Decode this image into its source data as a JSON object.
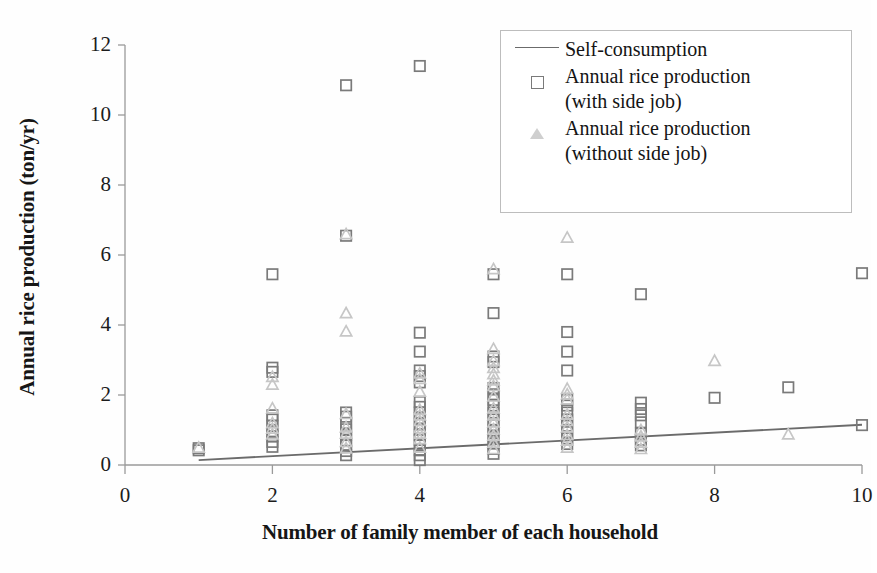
{
  "chart_data": {
    "type": "scatter",
    "title": "",
    "xlabel": "Number of family member of each household",
    "ylabel": "Annual rice production (ton/yr)",
    "xlim": [
      0,
      10
    ],
    "ylim": [
      0,
      12
    ],
    "xticks": [
      "0",
      "2",
      "4",
      "6",
      "8",
      "10"
    ],
    "yticks": [
      "0",
      "2",
      "4",
      "6",
      "8",
      "10",
      "12"
    ],
    "grid": false,
    "legend_position": "top-right",
    "colors": {
      "with_side_job": "#7a7a7a",
      "without_side_job": "#c6c6c6",
      "self_consumption": "#6b6b6b",
      "axis": "#9a9a9a",
      "text": "#161616",
      "background": "#fefefe"
    },
    "series": [
      {
        "name": "Self-consumption",
        "marker": "line",
        "type": "line",
        "points": [
          [
            1,
            0.14
          ],
          [
            10,
            1.15
          ]
        ]
      },
      {
        "name": "Annual rice production\n(with side job)",
        "marker": "open-square",
        "type": "scatter",
        "points": [
          [
            1,
            0.48
          ],
          [
            1,
            0.42
          ],
          [
            2,
            5.45
          ],
          [
            2,
            2.78
          ],
          [
            2,
            2.66
          ],
          [
            2,
            1.42
          ],
          [
            2,
            1.3
          ],
          [
            2,
            1.12
          ],
          [
            2,
            0.96
          ],
          [
            2,
            0.82
          ],
          [
            2,
            0.66
          ],
          [
            2,
            0.52
          ],
          [
            3,
            10.85
          ],
          [
            3,
            6.55
          ],
          [
            3,
            1.5
          ],
          [
            3,
            1.38
          ],
          [
            3,
            1.2
          ],
          [
            3,
            1.02
          ],
          [
            3,
            0.86
          ],
          [
            3,
            0.7
          ],
          [
            3,
            0.56
          ],
          [
            3,
            0.4
          ],
          [
            3,
            0.28
          ],
          [
            4,
            11.4
          ],
          [
            4,
            3.78
          ],
          [
            4,
            3.24
          ],
          [
            4,
            2.7
          ],
          [
            4,
            2.54
          ],
          [
            4,
            2.36
          ],
          [
            4,
            1.8
          ],
          [
            4,
            1.66
          ],
          [
            4,
            1.5
          ],
          [
            4,
            1.34
          ],
          [
            4,
            1.18
          ],
          [
            4,
            1.0
          ],
          [
            4,
            0.86
          ],
          [
            4,
            0.72
          ],
          [
            4,
            0.56
          ],
          [
            4,
            0.42
          ],
          [
            4,
            0.28
          ],
          [
            4,
            0.14
          ],
          [
            5,
            5.45
          ],
          [
            5,
            4.34
          ],
          [
            5,
            3.1
          ],
          [
            5,
            2.94
          ],
          [
            5,
            2.2
          ],
          [
            5,
            2.02
          ],
          [
            5,
            1.86
          ],
          [
            5,
            1.7
          ],
          [
            5,
            1.5
          ],
          [
            5,
            1.3
          ],
          [
            5,
            1.14
          ],
          [
            5,
            0.98
          ],
          [
            5,
            0.8
          ],
          [
            5,
            0.62
          ],
          [
            5,
            0.46
          ],
          [
            5,
            0.32
          ],
          [
            6,
            5.45
          ],
          [
            6,
            3.8
          ],
          [
            6,
            3.24
          ],
          [
            6,
            2.7
          ],
          [
            6,
            1.86
          ],
          [
            6,
            1.7
          ],
          [
            6,
            1.5
          ],
          [
            6,
            1.3
          ],
          [
            6,
            1.12
          ],
          [
            6,
            0.94
          ],
          [
            6,
            0.76
          ],
          [
            6,
            0.6
          ],
          [
            7,
            4.88
          ],
          [
            7,
            1.78
          ],
          [
            7,
            1.6
          ],
          [
            7,
            1.42
          ],
          [
            7,
            1.22
          ],
          [
            7,
            0.9
          ],
          [
            7,
            0.72
          ],
          [
            7,
            0.56
          ],
          [
            8,
            1.92
          ],
          [
            9,
            2.22
          ],
          [
            10,
            5.48
          ],
          [
            10,
            1.14
          ]
        ]
      },
      {
        "name": "Annual rice production\n(without side job)",
        "marker": "open-triangle",
        "type": "scatter",
        "points": [
          [
            1,
            0.5
          ],
          [
            2,
            2.52
          ],
          [
            2,
            2.3
          ],
          [
            2,
            1.62
          ],
          [
            2,
            1.2
          ],
          [
            2,
            1.04
          ],
          [
            2,
            0.88
          ],
          [
            3,
            6.6
          ],
          [
            3,
            4.34
          ],
          [
            3,
            3.82
          ],
          [
            3,
            1.46
          ],
          [
            3,
            1.08
          ],
          [
            3,
            0.9
          ],
          [
            3,
            0.66
          ],
          [
            3,
            0.48
          ],
          [
            4,
            2.62
          ],
          [
            4,
            2.46
          ],
          [
            4,
            2.1
          ],
          [
            4,
            1.58
          ],
          [
            4,
            1.42
          ],
          [
            4,
            1.26
          ],
          [
            4,
            1.06
          ],
          [
            4,
            0.9
          ],
          [
            4,
            0.74
          ],
          [
            4,
            0.5
          ],
          [
            5,
            5.6
          ],
          [
            5,
            3.32
          ],
          [
            5,
            2.98
          ],
          [
            5,
            2.78
          ],
          [
            5,
            2.6
          ],
          [
            5,
            2.42
          ],
          [
            5,
            2.26
          ],
          [
            5,
            1.96
          ],
          [
            5,
            1.62
          ],
          [
            5,
            1.42
          ],
          [
            5,
            1.22
          ],
          [
            5,
            1.02
          ],
          [
            5,
            0.84
          ],
          [
            5,
            0.64
          ],
          [
            5,
            0.46
          ],
          [
            6,
            6.5
          ],
          [
            6,
            2.18
          ],
          [
            6,
            2.02
          ],
          [
            6,
            1.88
          ],
          [
            6,
            1.44
          ],
          [
            6,
            1.26
          ],
          [
            6,
            1.08
          ],
          [
            6,
            0.86
          ],
          [
            6,
            0.7
          ],
          [
            6,
            0.5
          ],
          [
            7,
            1.0
          ],
          [
            7,
            0.82
          ],
          [
            7,
            0.64
          ],
          [
            7,
            0.46
          ],
          [
            8,
            2.98
          ],
          [
            9,
            0.88
          ]
        ]
      }
    ]
  },
  "legend": {
    "items": [
      {
        "label": "Self-consumption",
        "marker": "line"
      },
      {
        "label": "Annual rice production\n(with side job)",
        "marker": "open-square"
      },
      {
        "label": "Annual rice production\n(without side job)",
        "marker": "open-triangle"
      }
    ]
  }
}
